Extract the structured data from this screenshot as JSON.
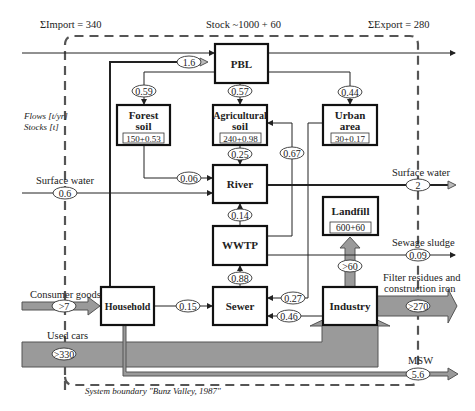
{
  "header": {
    "import_label": "ΣImport = 340",
    "stock_label": "Stock ~1000 + 60",
    "export_label": "ΣExport = 280"
  },
  "legend": {
    "flows_unit": "Flows [t/yr]",
    "stocks_unit": "Stocks [t]"
  },
  "boundary": {
    "label": "System boundary \"Bunz Valley, 1987\""
  },
  "processes": {
    "pbl": {
      "label": "PBL"
    },
    "forest_soil": {
      "line1": "Forest",
      "line2": "soil",
      "stock": "150+0.53"
    },
    "agricultural_soil": {
      "line1": "Agricultural",
      "line2": "soil",
      "stock": "240+0.98"
    },
    "urban_area": {
      "line1": "Urban",
      "line2": "area",
      "stock": "30+0.17"
    },
    "river": {
      "label": "River"
    },
    "wwtp": {
      "label": "WWTP"
    },
    "landfill": {
      "label": "Landfill",
      "stock": "600+60"
    },
    "household": {
      "label": "Household"
    },
    "sewer": {
      "label": "Sewer"
    },
    "industry": {
      "label": "Industry"
    }
  },
  "flows": {
    "household_to_pbl": "1.6",
    "pbl_to_forest": "0.59",
    "pbl_to_agri": "0.57",
    "pbl_to_urban": "0.44",
    "forest_to_river": "0.06",
    "agri_to_river": "0.25",
    "wwtp_to_agri": "0.67",
    "surface_water_in": "0.6",
    "surface_water_out": "2",
    "wwtp_to_river": "0.14",
    "sewer_to_wwtp": "0.88",
    "sewage_sludge": "0.09",
    "industry_to_landfill": ">60",
    "consumer_goods": ">7",
    "household_to_sewer": "0.15",
    "urban_to_sewer": "0.27",
    "industry_to_sewer": "0.46",
    "filter_residues": ">270",
    "used_cars": ">330",
    "msw": "5.6"
  },
  "flow_labels": {
    "surface_water_in": "Surface water",
    "surface_water_out": "Surface water",
    "sewage_sludge": "Sewage sludge",
    "filter_residues_line1": "Filter residues and",
    "filter_residues_line2": "construction iron",
    "consumer_goods": "Consumer goods",
    "used_cars": "Used cars",
    "msw": "MSW"
  },
  "colors": {
    "line": "#222222",
    "thick_arrow": "#9a9a9a",
    "boundary": "#555555"
  }
}
